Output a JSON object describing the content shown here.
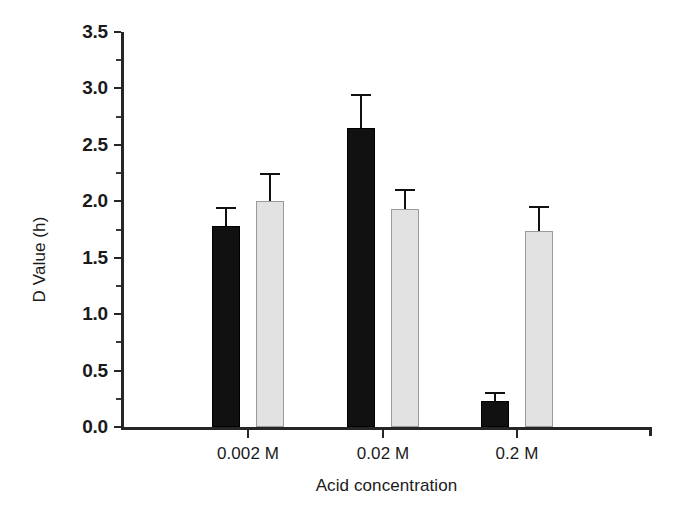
{
  "chart_data": {
    "type": "bar",
    "title": "",
    "xlabel": "Acid concentration",
    "ylabel": "D Value (h)",
    "categories": [
      "0.002 M",
      "0.02 M",
      "0.2 M"
    ],
    "ylim": [
      0.0,
      3.5
    ],
    "ytick_labels": [
      "0.0",
      "0.5",
      "1.0",
      "1.5",
      "2.0",
      "2.5",
      "3.0",
      "3.5"
    ],
    "ytick_values": [
      0.0,
      0.5,
      1.0,
      1.5,
      2.0,
      2.5,
      3.0,
      3.5
    ],
    "grid": false,
    "legend": "none",
    "series": [
      {
        "name": "black-series",
        "color": "#111111",
        "values": [
          1.78,
          2.65,
          0.23
        ],
        "errors": [
          0.17,
          0.3,
          0.08
        ]
      },
      {
        "name": "light-gray-series",
        "color": "#e2e2e2",
        "values": [
          2.0,
          1.93,
          1.74
        ],
        "errors": [
          0.25,
          0.18,
          0.22
        ]
      }
    ]
  },
  "axes": {
    "y_title": "D Value (h)",
    "x_title": "Acid concentration"
  },
  "yticks": [
    {
      "label": "3.5",
      "value": 3.5
    },
    {
      "label": "3.0",
      "value": 3.0
    },
    {
      "label": "2.5",
      "value": 2.5
    },
    {
      "label": "2.0",
      "value": 2.0
    },
    {
      "label": "1.5",
      "value": 1.5
    },
    {
      "label": "1.0",
      "value": 1.0
    },
    {
      "label": "0.5",
      "value": 0.5
    },
    {
      "label": "0.0",
      "value": 0.0
    }
  ],
  "xticks": [
    {
      "label": "0.002 M"
    },
    {
      "label": "0.02 M"
    },
    {
      "label": "0.2 M"
    }
  ]
}
